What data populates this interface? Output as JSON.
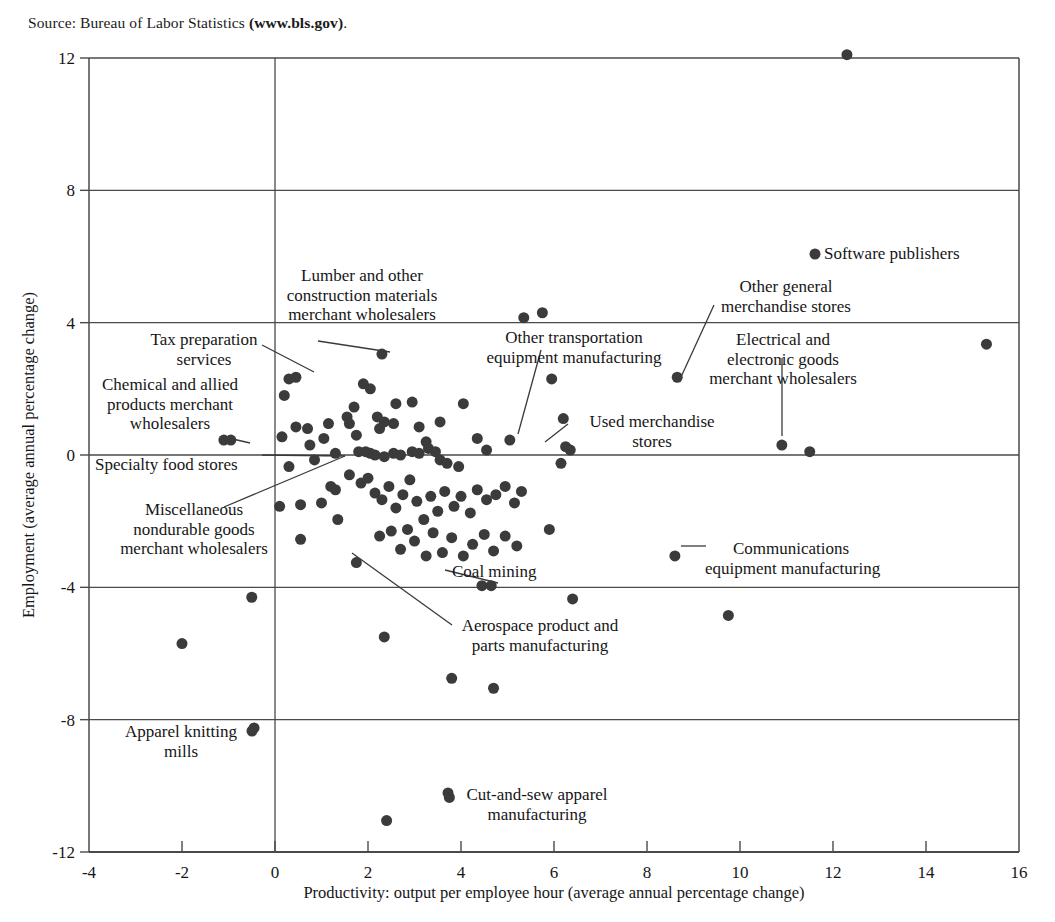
{
  "source": {
    "prefix": "Source: Bureau of Labor Statistics ",
    "bold": "(www.bls.gov)",
    "suffix": "."
  },
  "chart_data": {
    "type": "scatter",
    "title": "",
    "xlabel": "Productivity: output per employee hour (average annual percentage change)",
    "ylabel": "Employment (average annual percentage change)",
    "xlim": [
      -4,
      16
    ],
    "ylim": [
      -12,
      12
    ],
    "xticks": [
      -4,
      -2,
      0,
      2,
      4,
      6,
      8,
      10,
      12,
      14,
      16
    ],
    "yticks": [
      -12,
      -8,
      -4,
      0,
      4,
      8,
      12
    ],
    "xtick_labels": [
      "-4",
      "-2",
      "0",
      "2",
      "4",
      "6",
      "8",
      "10",
      "12",
      "14",
      "16"
    ],
    "ytick_labels": [
      "-12",
      "-8",
      "-4",
      "0",
      "4",
      "8",
      "12"
    ],
    "grid": "horizontal gridlines at y = 8, 4, 0, -4, -8; vertical reference line at x = 0",
    "legend": "none",
    "marker_color": "#3b3b3b",
    "marker_size_px": 11,
    "points": [
      [
        12.3,
        12.1
      ],
      [
        15.3,
        3.35
      ],
      [
        11.5,
        0.1
      ],
      [
        10.9,
        0.3
      ],
      [
        8.65,
        2.35
      ],
      [
        8.6,
        -3.05
      ],
      [
        9.75,
        -4.85
      ],
      [
        6.35,
        0.15
      ],
      [
        6.25,
        0.25
      ],
      [
        6.2,
        1.1
      ],
      [
        6.15,
        -0.25
      ],
      [
        5.95,
        2.3
      ],
      [
        5.9,
        -2.25
      ],
      [
        6.4,
        -4.35
      ],
      [
        5.75,
        4.3
      ],
      [
        5.35,
        4.15
      ],
      [
        5.05,
        0.45
      ],
      [
        4.65,
        -3.95
      ],
      [
        4.45,
        -3.95
      ],
      [
        4.7,
        -7.05
      ],
      [
        3.8,
        -6.75
      ],
      [
        3.75,
        -10.35
      ],
      [
        2.4,
        -11.05
      ],
      [
        2.35,
        -5.5
      ],
      [
        2.3,
        3.05
      ],
      [
        1.75,
        -3.25
      ],
      [
        0.45,
        2.35
      ],
      [
        0.3,
        2.3
      ],
      [
        0.2,
        1.8
      ],
      [
        -0.45,
        -8.25
      ],
      [
        -0.5,
        -4.3
      ],
      [
        -2.0,
        -5.7
      ],
      [
        -1.1,
        0.45
      ],
      [
        -0.95,
        0.45
      ],
      [
        0.15,
        0.55
      ],
      [
        0.45,
        0.85
      ],
      [
        0.7,
        0.8
      ],
      [
        0.75,
        0.3
      ],
      [
        1.05,
        0.5
      ],
      [
        1.15,
        0.95
      ],
      [
        1.3,
        0.05
      ],
      [
        0.3,
        -0.35
      ],
      [
        0.55,
        -1.5
      ],
      [
        1.0,
        -1.45
      ],
      [
        0.55,
        -2.55
      ],
      [
        1.3,
        -1.05
      ],
      [
        1.55,
        1.15
      ],
      [
        1.6,
        0.95
      ],
      [
        1.7,
        1.45
      ],
      [
        1.75,
        0.6
      ],
      [
        1.9,
        2.15
      ],
      [
        2.05,
        2.0
      ],
      [
        2.2,
        1.15
      ],
      [
        2.25,
        0.8
      ],
      [
        2.35,
        1.0
      ],
      [
        2.55,
        0.95
      ],
      [
        2.6,
        1.55
      ],
      [
        2.95,
        1.6
      ],
      [
        3.1,
        0.85
      ],
      [
        3.25,
        0.4
      ],
      [
        3.55,
        1.0
      ],
      [
        4.05,
        1.55
      ],
      [
        4.35,
        0.5
      ],
      [
        4.55,
        0.15
      ],
      [
        1.8,
        0.1
      ],
      [
        1.95,
        0.1
      ],
      [
        2.05,
        0.05
      ],
      [
        2.15,
        0.0
      ],
      [
        2.35,
        -0.05
      ],
      [
        2.55,
        0.05
      ],
      [
        2.7,
        0.0
      ],
      [
        2.95,
        0.1
      ],
      [
        3.1,
        0.05
      ],
      [
        3.3,
        0.2
      ],
      [
        3.45,
        0.1
      ],
      [
        3.55,
        -0.15
      ],
      [
        3.7,
        -0.25
      ],
      [
        3.95,
        -0.35
      ],
      [
        1.6,
        -0.6
      ],
      [
        1.85,
        -0.85
      ],
      [
        2.0,
        -0.7
      ],
      [
        2.15,
        -1.15
      ],
      [
        2.3,
        -1.35
      ],
      [
        2.45,
        -0.95
      ],
      [
        2.6,
        -1.6
      ],
      [
        2.75,
        -1.2
      ],
      [
        2.9,
        -0.75
      ],
      [
        3.05,
        -1.4
      ],
      [
        3.2,
        -1.95
      ],
      [
        3.35,
        -1.25
      ],
      [
        3.5,
        -1.7
      ],
      [
        3.65,
        -1.1
      ],
      [
        3.85,
        -1.55
      ],
      [
        4.0,
        -1.25
      ],
      [
        4.2,
        -1.75
      ],
      [
        4.35,
        -1.05
      ],
      [
        4.55,
        -1.35
      ],
      [
        4.75,
        -1.2
      ],
      [
        4.95,
        -0.95
      ],
      [
        5.15,
        -1.45
      ],
      [
        5.3,
        -1.1
      ],
      [
        2.25,
        -2.45
      ],
      [
        2.5,
        -2.3
      ],
      [
        2.7,
        -2.85
      ],
      [
        2.85,
        -2.25
      ],
      [
        3.0,
        -2.6
      ],
      [
        3.25,
        -3.05
      ],
      [
        3.4,
        -2.35
      ],
      [
        3.6,
        -2.95
      ],
      [
        3.8,
        -2.5
      ],
      [
        4.05,
        -3.05
      ],
      [
        4.25,
        -2.7
      ],
      [
        4.5,
        -2.4
      ],
      [
        4.7,
        -2.9
      ],
      [
        4.95,
        -2.45
      ],
      [
        5.2,
        -2.75
      ],
      [
        1.35,
        -1.95
      ],
      [
        1.2,
        -0.95
      ],
      [
        0.85,
        -0.15
      ],
      [
        0.1,
        -1.55
      ]
    ]
  },
  "annotations": [
    {
      "name": "lumber-construction",
      "lines": [
        "Lumber and other",
        "construction materials",
        "merchant wholesalers"
      ]
    },
    {
      "name": "tax-preparation",
      "lines": [
        "Tax preparation",
        "services"
      ]
    },
    {
      "name": "chemical-allied",
      "lines": [
        "Chemical and allied",
        "products merchant",
        "wholesalers"
      ]
    },
    {
      "name": "specialty-food",
      "lines": [
        "Specialty food stores"
      ]
    },
    {
      "name": "misc-nondurable",
      "lines": [
        "Miscellaneous",
        "nondurable goods",
        "merchant wholesalers"
      ]
    },
    {
      "name": "other-transportation",
      "lines": [
        "Other transportation",
        "equipment manufacturing"
      ]
    },
    {
      "name": "other-general-merchandise",
      "lines": [
        "Other general",
        "merchandise stores"
      ]
    },
    {
      "name": "electrical-electronic",
      "lines": [
        "Electrical and",
        "electronic goods",
        "merchant wholesalers"
      ]
    },
    {
      "name": "used-merchandise",
      "lines": [
        "Used merchandise",
        "stores"
      ]
    },
    {
      "name": "software-publishers",
      "lines": [
        "Software publishers"
      ]
    },
    {
      "name": "communications-equipment",
      "lines": [
        "Communications",
        "equipment manufacturing"
      ]
    },
    {
      "name": "coal-mining",
      "lines": [
        "Coal mining"
      ]
    },
    {
      "name": "aerospace-product",
      "lines": [
        "Aerospace product and",
        "parts manufacturing"
      ]
    },
    {
      "name": "apparel-knitting",
      "lines": [
        "Apparel knitting",
        "mills"
      ]
    },
    {
      "name": "cut-and-sew",
      "lines": [
        "Cut-and-sew apparel",
        "manufacturing"
      ]
    }
  ],
  "annotation_text": {
    "lumber_1": "Lumber and other",
    "lumber_2": "construction materials",
    "lumber_3": "merchant wholesalers",
    "tax_1": "Tax preparation",
    "tax_2": "services",
    "chem_1": "Chemical and allied",
    "chem_2": "products merchant",
    "chem_3": "wholesalers",
    "specialty_1": "Specialty food stores",
    "misc_1": "Miscellaneous",
    "misc_2": "nondurable goods",
    "misc_3": "merchant wholesalers",
    "othertrans_1": "Other transportation",
    "othertrans_2": "equipment manufacturing",
    "othergen_1": "Other general",
    "othergen_2": "merchandise stores",
    "elec_1": "Electrical and",
    "elec_2": "electronic goods",
    "elec_3": "merchant wholesalers",
    "used_1": "Used merchandise",
    "used_2": "stores",
    "software_1": "Software publishers",
    "comm_1": "Communications",
    "comm_2": "equipment manufacturing",
    "coal_1": "Coal mining",
    "aero_1": "Aerospace product and",
    "aero_2": "parts manufacturing",
    "knit_1": "Apparel knitting",
    "knit_2": "mills",
    "cutsew_1": "Cut-and-sew apparel",
    "cutsew_2": "manufacturing"
  }
}
